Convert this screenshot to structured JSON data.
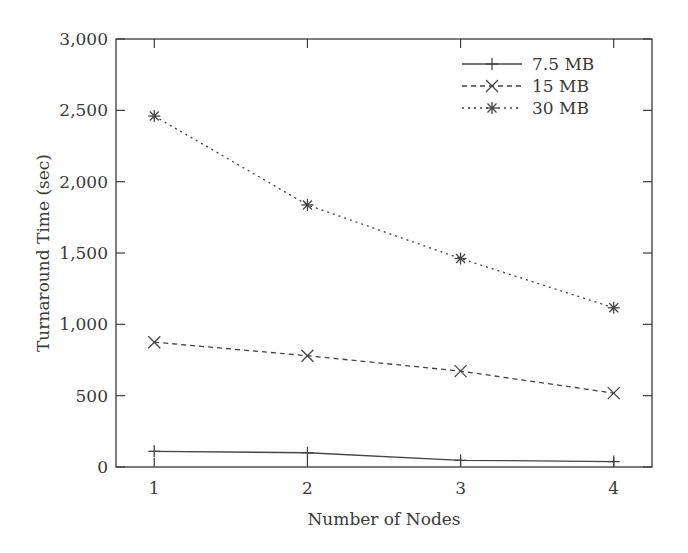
{
  "chart_data": {
    "type": "line",
    "title": "",
    "xlabel": "Number of Nodes",
    "ylabel": "Turnaround Time (sec)",
    "x": [
      1,
      2,
      3,
      4
    ],
    "x_tick_labels": [
      "1",
      "2",
      "3",
      "4"
    ],
    "xlim": [
      0.75,
      4.25
    ],
    "ylim": [
      0,
      3000
    ],
    "y_ticks": [
      0,
      500,
      1000,
      1500,
      2000,
      2500,
      3000
    ],
    "y_tick_labels": [
      "0",
      "500",
      "1,000",
      "1,500",
      "2,000",
      "2,500",
      "3,000"
    ],
    "grid": false,
    "legend_position": "upper right",
    "series": [
      {
        "name": "7.5 MB",
        "marker": "plus",
        "line_style": "solid",
        "values": [
          110,
          100,
          47,
          38
        ]
      },
      {
        "name": "15 MB",
        "marker": "x",
        "line_style": "dashed",
        "values": [
          875,
          780,
          672,
          518
        ]
      },
      {
        "name": "30 MB",
        "marker": "asterisk",
        "line_style": "dotted",
        "values": [
          2460,
          1837,
          1461,
          1116
        ]
      }
    ]
  },
  "colors": {
    "axis": "#3a3a3a",
    "line": "#444444",
    "background": "#ffffff"
  }
}
